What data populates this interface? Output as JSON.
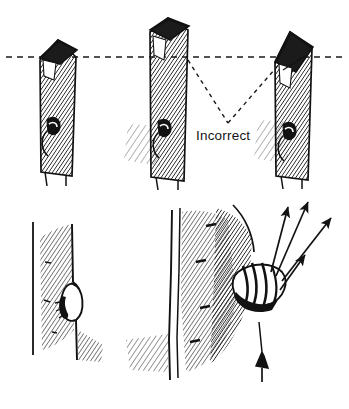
{
  "figure": {
    "background_color": "#ffffff",
    "ink_color": "#121212",
    "style": "pen-and-ink hatched line drawing"
  },
  "annotations": {
    "incorrect_label": "Incorrect",
    "label_color": "#151515",
    "leader_style": "dashed",
    "leader_apex": {
      "x": 228,
      "y": 123
    },
    "leader_targets": [
      {
        "x": 188,
        "y": 60
      },
      {
        "x": 281,
        "y": 62
      }
    ]
  },
  "reference_line": {
    "name": "bud-level-reference-line",
    "style": "dashed",
    "y": 57,
    "x_start": 6,
    "x_end": 344,
    "dash": "6 5"
  },
  "top_row": {
    "name": "pruning-cut-comparison",
    "stems": [
      {
        "id": "stem-1",
        "label": "",
        "cut_description": "Sloping cut level with the dashed reference line, just above the bud",
        "verdict": "reference",
        "cut_angle_deg": 22,
        "x_center": 57,
        "top_y": 33,
        "bottom_y": 175,
        "has_bud": true,
        "bud_y": 128
      },
      {
        "id": "stem-2",
        "label": "Incorrect",
        "cut_description": "Cut made too far above the bud, leaving a long snag",
        "verdict": "incorrect",
        "cut_angle_deg": 18,
        "x_center": 168,
        "top_y": 20,
        "bottom_y": 180,
        "has_bud": true,
        "bud_y": 130
      },
      {
        "id": "stem-3",
        "label": "Incorrect",
        "cut_description": "Cut made at too steep an angle, slicing down past the bud",
        "verdict": "incorrect",
        "cut_angle_deg": 48,
        "x_center": 297,
        "top_y": 32,
        "bottom_y": 178,
        "has_bud": true,
        "bud_y": 133
      }
    ]
  },
  "bottom_row": {
    "name": "bud-detail-illustrations",
    "panels": [
      {
        "id": "panel-dormant-bud",
        "caption": "",
        "description": "Close-up of a single dormant bud seated against the stem, shown in shadow",
        "x_center": 75,
        "y_center": 300,
        "bud_count": 1,
        "arrow_count": 0
      },
      {
        "id": "panel-shoot-growth",
        "caption": "",
        "description": "Bud union on a trunk with new shoots breaking away, growth directions marked by arrows",
        "x_center": 235,
        "y_center": 295,
        "bud_count": 1,
        "arrow_count": 4,
        "arrows": [
          {
            "id": "arrow-1",
            "from": {
              "x": 271,
              "y": 272
            },
            "to": {
              "x": 288,
              "y": 207
            }
          },
          {
            "id": "arrow-2",
            "from": {
              "x": 276,
              "y": 276
            },
            "to": {
              "x": 308,
              "y": 202
            }
          },
          {
            "id": "arrow-3",
            "from": {
              "x": 282,
              "y": 281
            },
            "to": {
              "x": 331,
              "y": 218
            }
          },
          {
            "id": "arrow-4",
            "from": {
              "x": 280,
              "y": 290
            },
            "to": {
              "x": 305,
              "y": 255
            }
          }
        ]
      }
    ]
  }
}
